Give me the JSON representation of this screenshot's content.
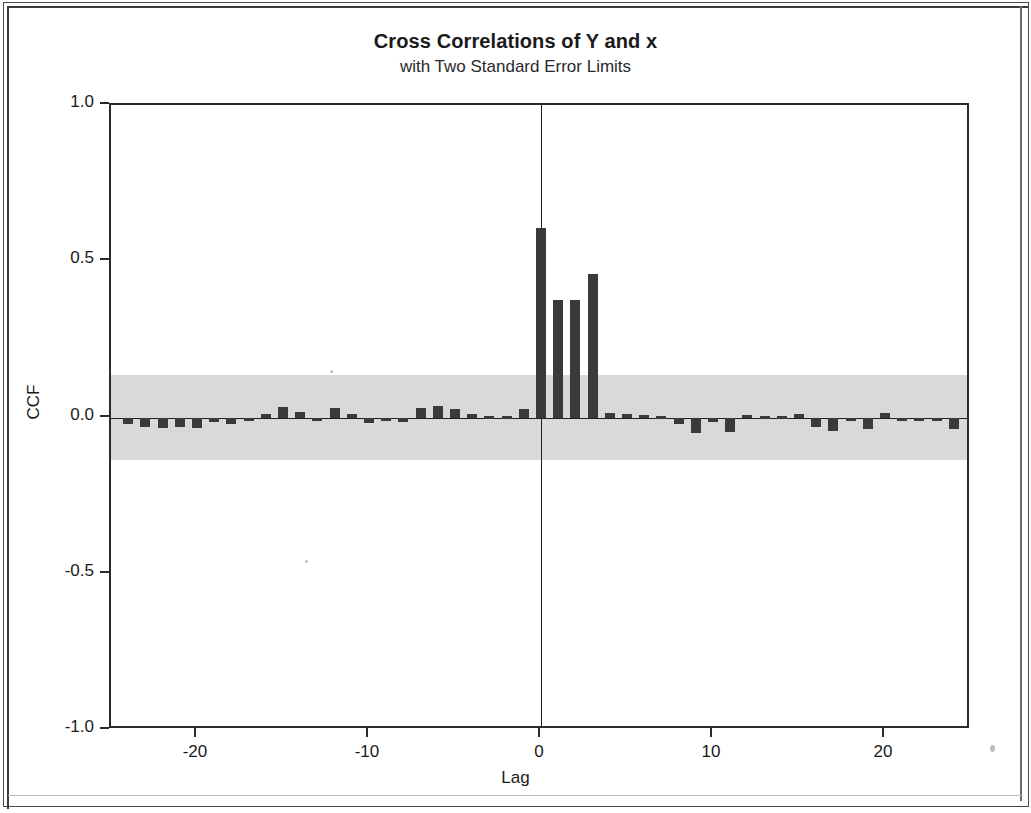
{
  "window": {
    "frame_label": "document-scan-frame"
  },
  "chart_data": {
    "type": "bar",
    "title": "Cross Correlations of Y and x",
    "subtitle": "with Two Standard Error Limits",
    "xlabel": "Lag",
    "ylabel": "CCF",
    "xlim": [
      -25,
      25
    ],
    "ylim": [
      -1.0,
      1.0
    ],
    "grid": false,
    "legend": "none",
    "y_ticks": [
      "1.0",
      "0.5",
      "0.0",
      "-0.5",
      "-1.0"
    ],
    "y_tick_values": [
      1.0,
      0.5,
      0.0,
      -0.5,
      -1.0
    ],
    "x_ticks": [
      "-20",
      "-10",
      "0",
      "10",
      "20"
    ],
    "x_tick_values": [
      -20,
      -10,
      0,
      10,
      20
    ],
    "significance_band": {
      "label": "two standard error limits",
      "upper": 0.135,
      "lower": -0.135,
      "color": "#d9d9d9"
    },
    "bar_color": "#3a3a3a",
    "categories": [
      -24,
      -23,
      -22,
      -21,
      -20,
      -19,
      -18,
      -17,
      -16,
      -15,
      -14,
      -13,
      -12,
      -11,
      -10,
      -9,
      -8,
      -7,
      -6,
      -5,
      -4,
      -3,
      -2,
      -1,
      0,
      1,
      2,
      3,
      4,
      5,
      6,
      7,
      8,
      9,
      10,
      11,
      12,
      13,
      14,
      15,
      16,
      17,
      18,
      19,
      20,
      21,
      22,
      23,
      24
    ],
    "values": [
      -0.022,
      -0.03,
      -0.034,
      -0.03,
      -0.033,
      -0.015,
      -0.021,
      -0.008,
      0.012,
      0.033,
      0.018,
      -0.006,
      0.03,
      0.012,
      -0.018,
      -0.008,
      -0.014,
      0.03,
      0.038,
      0.028,
      0.01,
      0.004,
      0.006,
      0.028,
      0.605,
      0.375,
      0.375,
      0.46,
      0.014,
      0.01,
      0.008,
      0.006,
      -0.02,
      -0.05,
      -0.014,
      -0.046,
      0.008,
      0.006,
      0.004,
      0.01,
      -0.03,
      -0.042,
      -0.012,
      -0.036,
      0.014,
      -0.01,
      -0.008,
      -0.012,
      -0.038
    ]
  },
  "axis_titles": {
    "x": "Lag",
    "y": "CCF"
  }
}
